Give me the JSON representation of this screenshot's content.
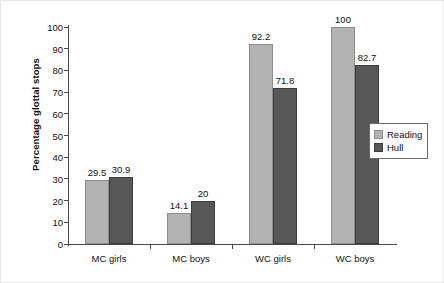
{
  "chart_data": {
    "type": "bar",
    "title": "",
    "subtitle": "",
    "xlabel": "",
    "ylabel": "Percentage glottal stops",
    "ylim": [
      0,
      100
    ],
    "ytick_step": 10,
    "yticks": [
      0,
      10,
      20,
      30,
      40,
      50,
      60,
      70,
      80,
      90,
      100
    ],
    "ytick_labels": [
      "0",
      "10",
      "20",
      "30",
      "40",
      "50",
      "60",
      "70",
      "80",
      "90",
      "100"
    ],
    "categories": [
      "MC girls",
      "MC boys",
      "WC girls",
      "WC boys"
    ],
    "grid": false,
    "legend_position": "right",
    "series": [
      {
        "name": "Reading",
        "color": "#b3b3b3",
        "values": [
          29.5,
          14.1,
          92.2,
          100
        ],
        "labels": [
          "29.5",
          "14.1",
          "92.2",
          "100"
        ]
      },
      {
        "name": "Hull",
        "color": "#575757",
        "values": [
          30.9,
          20,
          71.8,
          82.7
        ],
        "labels": [
          "30.9",
          "20",
          "71.8",
          "82.7"
        ]
      }
    ]
  }
}
